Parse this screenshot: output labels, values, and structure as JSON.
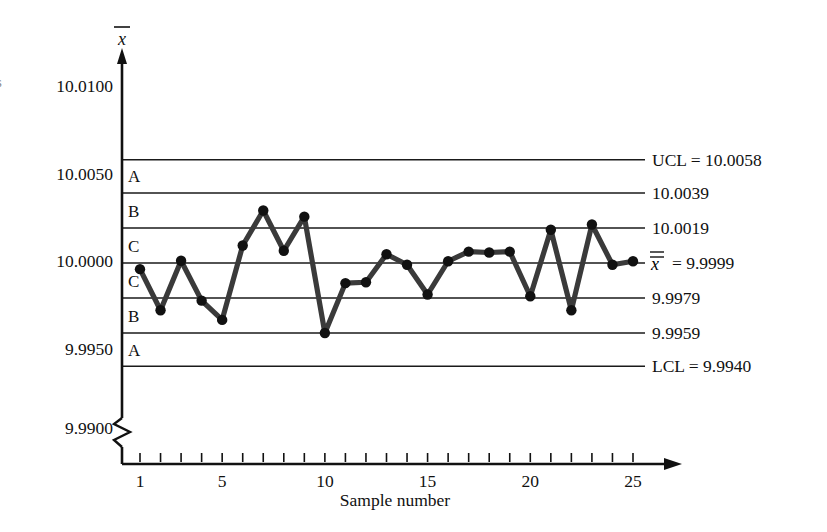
{
  "chart_data": {
    "type": "line",
    "title": "",
    "xlabel": "Sample number",
    "ylabel": "x̄",
    "x": [
      1,
      2,
      3,
      4,
      5,
      6,
      7,
      8,
      9,
      10,
      11,
      12,
      13,
      14,
      15,
      16,
      17,
      18,
      19,
      20,
      21,
      22,
      23,
      24,
      25
    ],
    "values": [
      9.99955,
      9.9972,
      10.00003,
      9.99775,
      9.99665,
      10.0009,
      10.0029,
      10.0006,
      10.00255,
      9.9959,
      9.99875,
      9.9988,
      10.0004,
      9.9998,
      9.9981,
      10.0,
      10.00055,
      10.0005,
      10.00055,
      9.998,
      10.0018,
      9.9972,
      10.0021,
      9.9998,
      10.0
    ],
    "series": [
      {
        "name": "x-bar",
        "values": [
          9.99955,
          9.9972,
          10.00003,
          9.99775,
          9.99665,
          10.0009,
          10.0029,
          10.0006,
          10.00255,
          9.9959,
          9.99875,
          9.9988,
          10.0004,
          9.9998,
          9.9981,
          10.0,
          10.00055,
          10.0005,
          10.00055,
          9.998,
          10.0018,
          9.9972,
          10.0021,
          9.9998,
          10.0
        ]
      }
    ],
    "ylim": [
      9.994,
      10.01
    ],
    "xlim": [
      1,
      25
    ],
    "grid": false,
    "legend": false,
    "y_ticks": [
      {
        "value": 10.01,
        "label": "10.0100"
      },
      {
        "value": 10.005,
        "label": "10.0050"
      },
      {
        "value": 10.0,
        "label": "10.0000"
      },
      {
        "value": 9.995,
        "label": "9.9950"
      },
      {
        "value": 9.99,
        "label": "9.9900"
      }
    ],
    "x_ticks": [
      {
        "value": 1,
        "label": "1"
      },
      {
        "value": 5,
        "label": "5"
      },
      {
        "value": 10,
        "label": "10"
      },
      {
        "value": 15,
        "label": "15"
      },
      {
        "value": 20,
        "label": "20"
      },
      {
        "value": 25,
        "label": "25"
      }
    ],
    "control_limits": [
      {
        "id": "ucl",
        "value": 10.0058,
        "label": "UCL = 10.0058"
      },
      {
        "id": "upper-2sigma",
        "value": 10.0039,
        "label": "10.0039"
      },
      {
        "id": "upper-1sigma",
        "value": 10.0019,
        "label": "10.0019"
      },
      {
        "id": "center",
        "value": 9.9999,
        "label": "= 9.9999"
      },
      {
        "id": "lower-1sigma",
        "value": 9.9979,
        "label": "9.9979"
      },
      {
        "id": "lower-2sigma",
        "value": 9.9959,
        "label": "9.9959"
      },
      {
        "id": "lcl",
        "value": 9.994,
        "label": "LCL = 9.9940"
      }
    ],
    "zones": [
      {
        "id": "zone-upper-a",
        "label": "A",
        "upper": 10.0058,
        "lower": 10.0039
      },
      {
        "id": "zone-upper-b",
        "label": "B",
        "upper": 10.0039,
        "lower": 10.0019
      },
      {
        "id": "zone-upper-c",
        "label": "C",
        "upper": 10.0019,
        "lower": 9.9999
      },
      {
        "id": "zone-lower-c",
        "label": "C",
        "upper": 9.9999,
        "lower": 9.9979
      },
      {
        "id": "zone-lower-b",
        "label": "B",
        "upper": 9.9979,
        "lower": 9.9959
      },
      {
        "id": "zone-lower-a",
        "label": "A",
        "upper": 9.9959,
        "lower": 9.994
      }
    ],
    "center_line_symbol": "x",
    "axis_break": true,
    "colors": {
      "line": "#3a3a3a",
      "point": "#111111",
      "limit": "#1a1a1a",
      "axis": "#111111",
      "background": "#ffffff"
    }
  },
  "edge_fragment": "s"
}
